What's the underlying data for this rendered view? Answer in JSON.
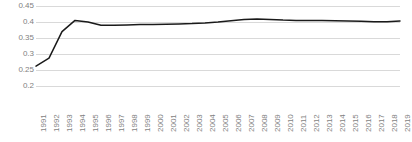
{
  "chart_data": {
    "type": "line",
    "title": "",
    "subtitle": "",
    "xlabel": "",
    "ylabel": "",
    "grid": true,
    "legend": false,
    "legend_position": "none",
    "line_color": "#1a1a1a",
    "grid_color": "#d9d9d9",
    "text_color": "#7f7f7f",
    "background_color": "#ffffff",
    "ylim": [
      0.2,
      0.45
    ],
    "y_ticks": [
      0.2,
      0.25,
      0.3,
      0.35,
      0.4,
      0.45
    ],
    "y_tick_labels": [
      "0.2",
      "0.25",
      "0.3",
      "0.35",
      "0.4",
      "0.45"
    ],
    "categories": [
      "1991",
      "1992",
      "1993",
      "1994",
      "1995",
      "1996",
      "1997",
      "1998",
      "1999",
      "2000",
      "2001",
      "2002",
      "2003",
      "2004",
      "2005",
      "2006",
      "2007",
      "2008",
      "2009",
      "2010",
      "2011",
      "2012",
      "2013",
      "2014",
      "2015",
      "2016",
      "2017",
      "2018",
      "2019"
    ],
    "values": [
      0.262,
      0.287,
      0.37,
      0.405,
      0.4,
      0.39,
      0.39,
      0.391,
      0.392,
      0.392,
      0.393,
      0.394,
      0.395,
      0.397,
      0.4,
      0.404,
      0.408,
      0.409,
      0.408,
      0.406,
      0.405,
      0.405,
      0.405,
      0.404,
      0.403,
      0.402,
      0.401,
      0.401,
      0.403
    ]
  }
}
